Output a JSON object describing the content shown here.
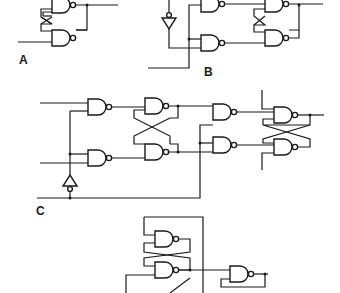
{
  "figure": {
    "line_color": "#1a1a1a",
    "background": "#ffffff"
  },
  "circuits": [
    {
      "id": "A",
      "label": "A",
      "components": [
        "2 cross-coupled NAND gates (SR latch)"
      ]
    },
    {
      "id": "B",
      "label": "B",
      "components": [
        "inverter",
        "2 input NAND gates",
        "2 cross-coupled NAND gates"
      ]
    },
    {
      "id": "C",
      "label": "C",
      "components": [
        "inverter",
        "2 input NAND gates",
        "2 cross-coupled NAND gates (master)",
        "2 steering NAND gates",
        "2 cross-coupled NAND gates (slave)"
      ]
    },
    {
      "id": "D",
      "label": "",
      "components": [
        "2 cross-coupled NAND gates",
        "1 NAND gate with feedback"
      ]
    }
  ]
}
